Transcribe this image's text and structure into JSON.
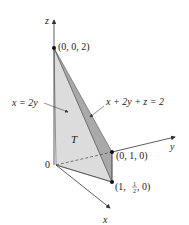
{
  "figure": {
    "axes": {
      "x_label": "x",
      "y_label": "y",
      "z_label": "z",
      "origin_label": "0"
    },
    "points": {
      "p_z": "(0, 0, 2)",
      "p_y": "(0, 1, 0)",
      "p_xy_open": "(1, ",
      "p_xy_num": "1",
      "p_xy_den": "2",
      "p_xy_close": ", 0)"
    },
    "labels": {
      "plane_left": "x = 2y",
      "plane_right": "x + 2y + z = 2",
      "region": "T"
    },
    "colors": {
      "face_light": "#dcdcdc",
      "face_dark": "#a9a9a9",
      "axis": "#333333",
      "point": "#111111"
    }
  }
}
